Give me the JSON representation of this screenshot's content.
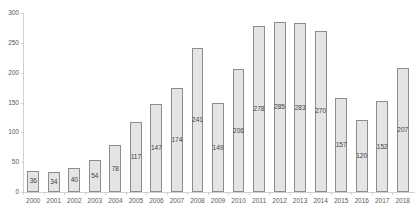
{
  "chart_data": {
    "type": "bar",
    "title": "",
    "xlabel": "",
    "ylabel": "",
    "ylim": [
      0,
      300
    ],
    "yticks": [
      0,
      50,
      100,
      150,
      200,
      250,
      300
    ],
    "grid": false,
    "legend": null,
    "categories": [
      "2000",
      "2001",
      "2002",
      "2003",
      "2004",
      "2005",
      "2006",
      "2007",
      "2008",
      "2009",
      "2010",
      "2011",
      "2012",
      "2013",
      "2014",
      "2015",
      "2016",
      "2017",
      "2018"
    ],
    "values": [
      36,
      34,
      40,
      54,
      78,
      117,
      147,
      174,
      241,
      149,
      206,
      278,
      285,
      283,
      270,
      157,
      120,
      152,
      207
    ],
    "data_labels": true,
    "colors": {
      "bar_fill": "#e4e4e4",
      "bar_border": "#8c8c8c",
      "axis": "#d0d0d0",
      "text": "#595959"
    }
  }
}
